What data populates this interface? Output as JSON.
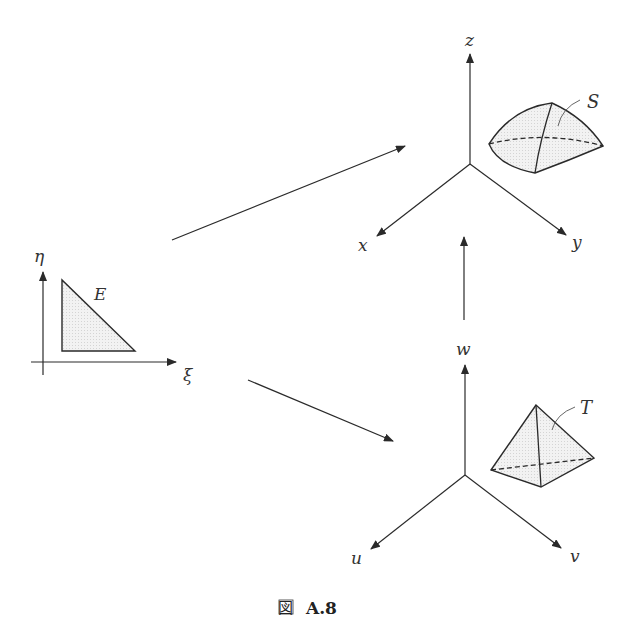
{
  "diagram": {
    "caption": {
      "prefix": "図",
      "label": "A.8"
    },
    "reference_element": {
      "label": "E",
      "axes": {
        "horizontal": "ξ",
        "vertical": "η"
      },
      "shape": "right-triangle"
    },
    "physical_space": {
      "axes": {
        "x": "x",
        "y": "y",
        "z": "z"
      },
      "element_label": "S",
      "shape": "curved-tetrahedron"
    },
    "parametric_space": {
      "axes": {
        "u": "u",
        "v": "v",
        "w": "w"
      },
      "element_label": "T",
      "shape": "tetrahedron"
    },
    "mappings": [
      {
        "from": "E",
        "to": "S"
      },
      {
        "from": "E",
        "to": "T"
      },
      {
        "from": "T",
        "to": "S"
      }
    ],
    "colors": {
      "line": "#2a2a2a",
      "fill": "#ececec",
      "text": "#333333"
    }
  }
}
